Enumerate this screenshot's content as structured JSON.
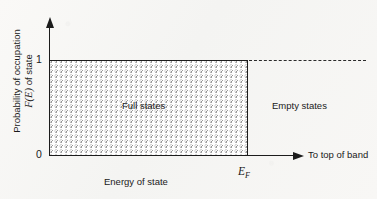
{
  "chart_data": {
    "type": "line",
    "xlabel": "Energy of state",
    "ylabel_line1": "Probability of occupation",
    "ylabel_line2_symbol": "F(E)",
    "ylabel_line2_rest": " of state",
    "x": [
      "0",
      "E_F",
      "top of band"
    ],
    "y_ticks": [
      "0",
      "1"
    ],
    "ylim": [
      0,
      1
    ],
    "series": [
      {
        "name": "F(E) at T = 0 K",
        "points": [
          {
            "x": 0,
            "y": 1
          },
          {
            "x": 1,
            "y": 1
          },
          {
            "x": 1,
            "y": 0
          }
        ],
        "style": "step-down-at-fermi-level"
      },
      {
        "name": "F(E) = 1 reference level",
        "points": [
          {
            "x": 1,
            "y": 1
          },
          {
            "x": 1.6,
            "y": 1
          }
        ],
        "style": "dashed"
      }
    ],
    "shaded_regions": [
      {
        "name": "Full states",
        "label": "Full states",
        "x_from": 0,
        "x_to": 1,
        "y_from": 0,
        "y_to": 1,
        "fill": "stipple"
      },
      {
        "name": "Empty states",
        "label": "Empty states",
        "x_from": 1,
        "x_to": 1.6,
        "y_from": 0,
        "y_to": 1,
        "fill": "none"
      }
    ],
    "annotations": [
      {
        "name": "fermi-level",
        "text": "E_F",
        "at_x": 1,
        "at_y": 0
      },
      {
        "name": "band-direction",
        "text": "To top of band",
        "at_x": 1.4,
        "at_y": 0
      }
    ],
    "grid": false,
    "legend": "none"
  },
  "axes": {
    "y_tick_one": "1",
    "y_tick_zero": "0",
    "y_title_line1": "Probability of occupation",
    "y_title_symbol": "F(E)",
    "y_title_line2_rest": " of state",
    "x_title": "Energy of state"
  },
  "labels": {
    "full_states": "Full states",
    "empty_states": "Empty states",
    "fermi_symbol": "E",
    "fermi_subscript": "F",
    "band_direction": "To top of band"
  },
  "colors": {
    "background": "#f7f7f5",
    "ink": "#1c1c1c",
    "stipple": "#9a9a9a",
    "dashed": "#2a2a2a"
  }
}
